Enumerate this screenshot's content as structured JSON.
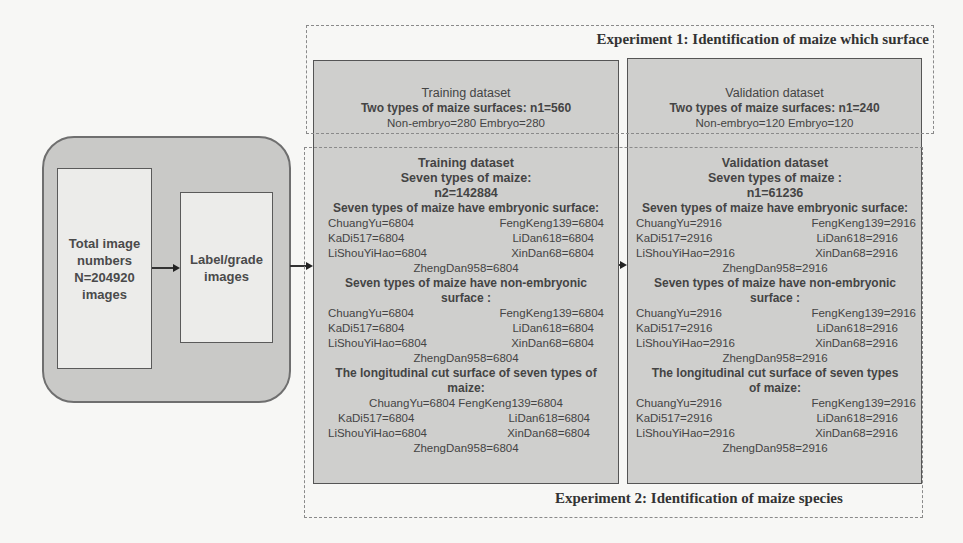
{
  "pipeline": {
    "total_box": {
      "lines": [
        "Total image",
        "numbers",
        "N=204920",
        "images"
      ]
    },
    "label_box": {
      "lines": [
        "Label/grade",
        "images"
      ]
    }
  },
  "experiment1": {
    "title": "Experiment 1: Identification of maize which surface",
    "training": {
      "heading": "Training dataset",
      "subheading": "Two types of maize surfaces: n1=560",
      "detail": "Non-embryo=280 Embryo=280"
    },
    "validation": {
      "heading": "Validation dataset",
      "subheading": "Two types of maize surfaces: n1=240",
      "detail": "Non-embryo=120 Embryo=120"
    }
  },
  "experiment2": {
    "title": "Experiment 2: Identification of maize species",
    "training": {
      "heading": "Training dataset",
      "subheading": "Seven types of maize:",
      "count": "n2=142884",
      "sections": [
        {
          "title": "Seven types of maize have embryonic surface:",
          "rows": [
            [
              "ChuangYu=6804",
              "FengKeng139=6804"
            ],
            [
              "KaDi517=6804",
              "LiDan618=6804"
            ],
            [
              "LiShouYiHao=6804",
              "XinDan68=6804"
            ]
          ],
          "last": "ZhengDan958=6804"
        },
        {
          "title": "Seven types of maize have non-embryonic surface :",
          "rows": [
            [
              "ChuangYu=6804",
              "FengKeng139=6804"
            ],
            [
              "KaDi517=6804",
              "LiDan618=6804"
            ],
            [
              "LiShouYiHao=6804",
              "XinDan68=6804"
            ]
          ],
          "last": "ZhengDan958=6804"
        },
        {
          "title": "The longitudinal cut surface of seven types of maize:",
          "first_line": "ChuangYu=6804 FengKeng139=6804",
          "rows": [
            [
              "KaDi517=6804",
              "LiDan618=6804"
            ],
            [
              "LiShouYiHao=6804",
              "XinDan68=6804"
            ]
          ],
          "last": "ZhengDan958=6804"
        }
      ]
    },
    "validation": {
      "heading": "Validation dataset",
      "subheading": "Seven types of maize :",
      "count": "n1=61236",
      "sections": [
        {
          "title": "Seven types of maize have embryonic surface:",
          "rows": [
            [
              "ChuangYu=2916",
              "FengKeng139=2916"
            ],
            [
              "KaDi517=2916",
              "LiDan618=2916"
            ],
            [
              "LiShouYiHao=2916",
              "XinDan68=2916"
            ]
          ],
          "last": "ZhengDan958=2916"
        },
        {
          "title": "Seven types of maize have non-embryonic surface :",
          "rows": [
            [
              "ChuangYu=2916",
              "FengKeng139=2916"
            ],
            [
              "KaDi517=2916",
              "LiDan618=2916"
            ],
            [
              "LiShouYiHao=2916",
              "XinDan68=2916"
            ]
          ],
          "last": "ZhengDan958=2916"
        },
        {
          "title": "The longitudinal cut surface of seven types of maize:",
          "rows": [
            [
              "ChuangYu=2916",
              "FengKeng139=2916"
            ],
            [
              "KaDi517=2916",
              "LiDan618=2916"
            ],
            [
              "LiShouYiHao=2916",
              "XinDan68=2916"
            ]
          ],
          "last": "ZhengDan958=2916"
        }
      ]
    }
  }
}
